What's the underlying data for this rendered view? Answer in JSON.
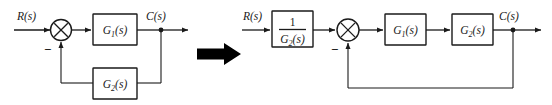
{
  "figure": {
    "transition_icon": "right-arrow-icon"
  },
  "left_diagram": {
    "name": "original-block-diagram",
    "input_label": "R(s)",
    "output_label": "C(s)",
    "summing_junction": {
      "icon": "summing-junction-icon",
      "feedback_sign": "−"
    },
    "forward_block": {
      "label": "G₁(s)",
      "base": "G",
      "sub": "1",
      "arg": "(s)"
    },
    "feedback_block": {
      "label": "G₂(s)",
      "base": "G",
      "sub": "2",
      "arg": "(s)"
    }
  },
  "right_diagram": {
    "name": "reduced-block-diagram",
    "input_label": "R(s)",
    "output_label": "C(s)",
    "summing_junction": {
      "icon": "summing-junction-icon",
      "feedback_sign": "−"
    },
    "prefilter_block": {
      "numerator": "1",
      "denominator": "G₂(s)",
      "den_base": "G",
      "den_sub": "2",
      "den_arg": "(s)"
    },
    "forward_block_1": {
      "label": "G₁(s)",
      "base": "G",
      "sub": "1",
      "arg": "(s)"
    },
    "forward_block_2": {
      "label": "G₂(s)",
      "base": "G",
      "sub": "2",
      "arg": "(s)"
    }
  },
  "colors": {
    "line": "#1a1a1a",
    "background": "#ffffff",
    "arrow_fill": "#000000"
  }
}
